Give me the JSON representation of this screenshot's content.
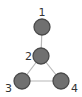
{
  "graph": {
    "nodes": [
      {
        "id": "1",
        "label": "1"
      },
      {
        "id": "2",
        "label": "2"
      },
      {
        "id": "3",
        "label": "3"
      },
      {
        "id": "4",
        "label": "4"
      }
    ],
    "edges": [
      {
        "from": "1",
        "to": "2"
      },
      {
        "from": "2",
        "to": "3"
      },
      {
        "from": "2",
        "to": "4"
      },
      {
        "from": "3",
        "to": "4"
      }
    ],
    "colors": {
      "node_fill": "#707070",
      "node_stroke": "#4a4a4a",
      "edge": "#b8b8b8",
      "label": "#333333"
    }
  }
}
